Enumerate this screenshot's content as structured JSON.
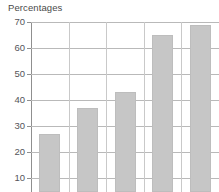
{
  "chart_data": {
    "type": "bar",
    "title": "Percentages",
    "subtitle": "",
    "xlabel": "",
    "ylabel": "",
    "categories": [
      "",
      "",
      "",
      "",
      ""
    ],
    "values": [
      27,
      37,
      43,
      65,
      69
    ],
    "ylim": [
      10,
      70
    ],
    "ytick_labels": [
      "70",
      "60",
      "50",
      "40",
      "30",
      "20",
      "10"
    ],
    "ytick_values": [
      70,
      60,
      50,
      40,
      30,
      20,
      10
    ],
    "grid": true,
    "legend": false,
    "legend_position": "none",
    "bar_color": "#c6c6c6",
    "gridline_color": "#b9b9b9",
    "axis_color": "#8f8f8f",
    "text_color": "#55555a",
    "background": "#ffffff"
  }
}
